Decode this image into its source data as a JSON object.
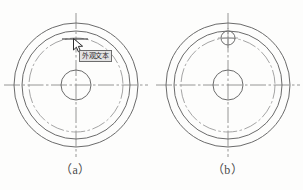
{
  "figure": {
    "background_color": "#fdfdfc",
    "line_color": "#6b6b6b",
    "centerline_color": "#8a8a8a",
    "panels": [
      {
        "id": "a",
        "caption": "（a）",
        "description": "flange blank with cursor hovering at bolt hole location",
        "center_x": 76,
        "center_y": 85,
        "outer_circle_r": 62,
        "inner_ring_r": 54,
        "bolt_circle_r": 47,
        "center_hole_r": 15,
        "has_bolt_hole": false,
        "has_cursor": true,
        "has_tooltip": true,
        "centerline_extent": 72
      },
      {
        "id": "b",
        "caption": "（b）",
        "description": "flange with bolt hole drawn on bolt circle at top",
        "center_x": 76,
        "center_y": 85,
        "outer_circle_r": 62,
        "inner_ring_r": 54,
        "bolt_circle_r": 47,
        "center_hole_r": 15,
        "has_bolt_hole": true,
        "bolt_hole_r": 7,
        "bolt_hole_angle_deg": 90,
        "has_cursor": false,
        "has_tooltip": false,
        "centerline_extent": 72
      }
    ]
  },
  "tooltip": {
    "text": "外观文本",
    "border_color": "#6d6d6d",
    "background_color": "#e2e2e2"
  },
  "cursor": {
    "icon": "arrow-pointer-icon",
    "x": 73,
    "y": 38
  }
}
